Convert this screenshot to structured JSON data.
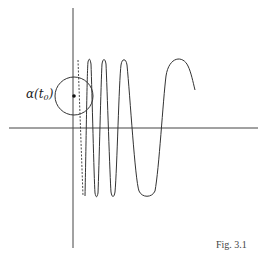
{
  "figure": {
    "caption": "Fig. 3.1",
    "point_label": {
      "symbol": "α(t",
      "subscript": "0",
      "close": ")"
    },
    "colors": {
      "stroke": "#333333",
      "axis": "#444444",
      "background": "#ffffff"
    },
    "elements": {
      "axes": {
        "x_axis": {
          "from": [
            9,
            128
          ],
          "to": [
            258,
            128
          ]
        },
        "y_axis": {
          "from": [
            73,
            8
          ],
          "to": [
            73,
            248
          ]
        }
      },
      "circle": {
        "center": [
          74,
          96
        ],
        "radius": 19
      },
      "point": {
        "center": [
          74,
          96
        ]
      },
      "dashed_line": {
        "from": [
          78,
          60
        ],
        "to": [
          83,
          196
        ]
      },
      "curve_description": "oscillating curve with increasing wavelength, peaks near y=61, troughs near y=196, ending in an arch"
    }
  }
}
